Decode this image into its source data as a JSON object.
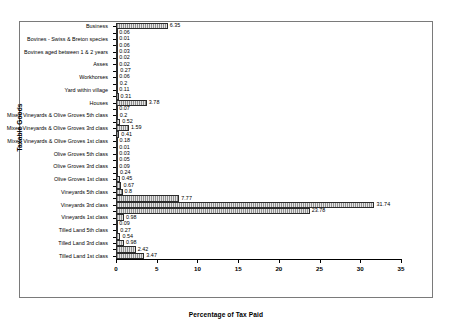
{
  "chart_data": {
    "type": "bar",
    "orientation": "horizontal",
    "title": "",
    "xlabel": "Percentage of Tax Paid",
    "ylabel": "Taxable Goods",
    "xlim": [
      0,
      35
    ],
    "xticks": [
      0,
      5,
      10,
      15,
      20,
      25,
      30,
      35
    ],
    "grid": false,
    "legend": null,
    "categories": [
      "Business",
      "",
      "Bovines - Swiss & Breton species",
      "",
      "Bovines aged between 1 & 2 years",
      "",
      "Asses",
      "",
      "Workhorses",
      "",
      "Yard within village",
      "",
      "Houses",
      "",
      "Mixed Vineyards & Olive Groves 5th class",
      "",
      "Mixed Vineyards & Olive Groves 3rd class",
      "",
      "Mixed Vineyards & Olive Groves 1st class",
      "",
      "Olive Groves 5th class",
      "",
      "Olive Groves 3rd class",
      "",
      "Olive Groves 1st class",
      "",
      "Vineyards 5th class",
      "",
      "Vineyards 3rd class",
      "",
      "Vineyards 1st class",
      "",
      "Tilled Land 5th class",
      "",
      "Tilled Land 3rd class",
      "",
      "Tilled Land 1st class"
    ],
    "values": [
      6.35,
      0.06,
      0.01,
      0.06,
      0.03,
      0.02,
      0.02,
      0.27,
      0.06,
      0.2,
      0.11,
      0.31,
      3.78,
      0.07,
      0.2,
      0.52,
      1.59,
      0.41,
      0.18,
      0.01,
      0.03,
      0.05,
      0.09,
      0.24,
      0.45,
      0.67,
      0.8,
      7.77,
      31.74,
      23.78,
      0.98,
      0.09,
      0.27,
      0.54,
      0.98,
      2.42,
      3.47
    ],
    "value_labels": [
      "6.35",
      "0.06",
      "0.01",
      "0.06",
      "0.03",
      "0.02",
      "0.02",
      "0.27",
      "0.06",
      "0.2",
      "0.11",
      "0.31",
      "3.78",
      "0.07",
      "0.2",
      "0.52",
      "1.59",
      "0.41",
      "0.18",
      "0.01",
      "0.03",
      "0.05",
      "0.09",
      "0.24",
      "0.45",
      "0.67",
      "0.8",
      "7.77",
      "31.74",
      "23.78",
      "0.98",
      "0.09",
      "0.27",
      "0.54",
      "0.98",
      "2.42",
      "3.47"
    ]
  },
  "axes": {
    "x_title": "Percentage of Tax Paid",
    "y_title": "Taxable Goods"
  },
  "colors": {
    "bar_fill": "#b9b9b9",
    "bar_edge": "#2b2b2b",
    "frame": "#7a7a7a",
    "axis": "#000000",
    "text": "#000000"
  }
}
